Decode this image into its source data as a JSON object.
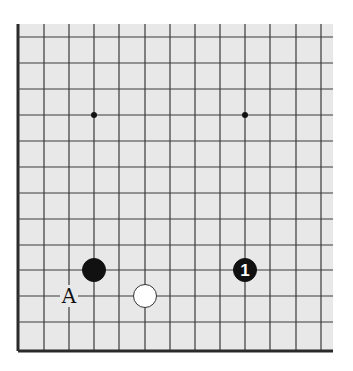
{
  "board": {
    "background": "#e8e8e8",
    "line_color": "#3a3a3a",
    "edge_color": "#2a2a2a",
    "area": {
      "left": 18,
      "top": 24,
      "right": 333,
      "bottom": 351
    },
    "verticals_x": [
      18,
      44,
      69,
      94,
      119,
      145,
      170,
      195,
      220,
      245,
      270,
      296,
      321
    ],
    "horizontals_y": [
      37,
      63,
      89,
      115,
      141,
      167,
      193,
      219,
      245,
      270,
      296,
      322,
      351
    ],
    "left_edge_x": 18,
    "bottom_edge_y": 351
  },
  "star_points": [
    {
      "x": 94,
      "y": 115
    },
    {
      "x": 245,
      "y": 115
    }
  ],
  "stones": [
    {
      "color": "black",
      "x": 94,
      "y": 270,
      "label": ""
    },
    {
      "color": "white",
      "x": 145,
      "y": 296,
      "label": ""
    },
    {
      "color": "black",
      "x": 245,
      "y": 270,
      "label": "1"
    }
  ],
  "markers": [
    {
      "text": "A",
      "x": 69,
      "y": 296
    }
  ]
}
